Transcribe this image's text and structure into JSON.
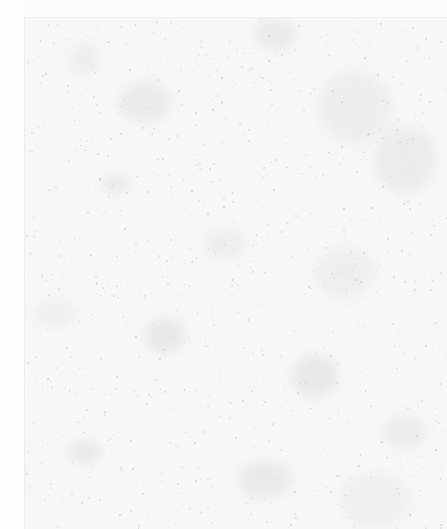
{
  "document": {
    "type": "degraded-scan",
    "legible_text": [],
    "colors": {
      "paper": "#fcfcfc",
      "scan_area": "#f7f7f7",
      "noise": "#b9b9b9",
      "border": "#ececec"
    },
    "scan_area": {
      "left": 24,
      "top": 17
    }
  }
}
